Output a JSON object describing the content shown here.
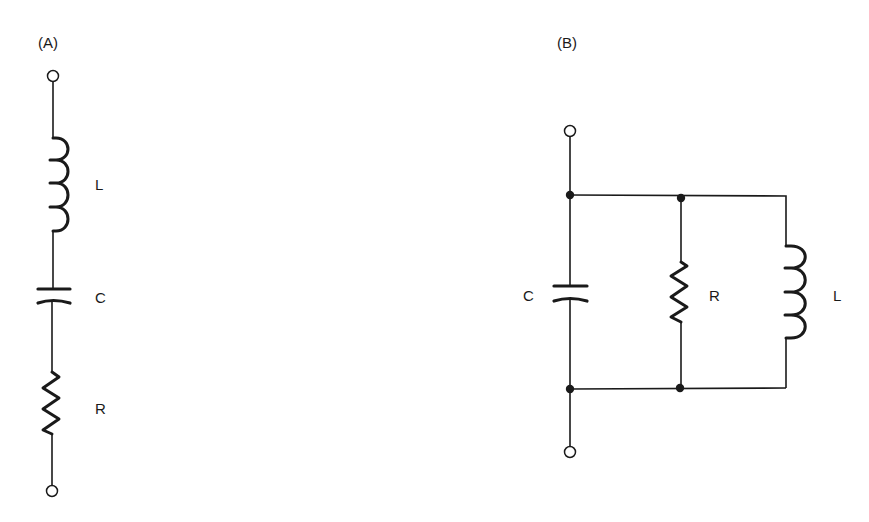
{
  "diagram": {
    "type": "circuit-schematic",
    "colors": {
      "ink": "#1a1a1a",
      "background": "#ffffff"
    },
    "circuits": [
      {
        "id": "A",
        "title": "(A)",
        "topology": "series RLC",
        "components": [
          {
            "type": "inductor",
            "label": "L"
          },
          {
            "type": "capacitor",
            "label": "C"
          },
          {
            "type": "resistor",
            "label": "R"
          }
        ],
        "terminals": 2
      },
      {
        "id": "B",
        "title": "(B)",
        "topology": "parallel RLC",
        "components": [
          {
            "type": "capacitor",
            "label": "C"
          },
          {
            "type": "resistor",
            "label": "R"
          },
          {
            "type": "inductor",
            "label": "L"
          }
        ],
        "terminals": 2,
        "junction_nodes": 4
      }
    ]
  }
}
